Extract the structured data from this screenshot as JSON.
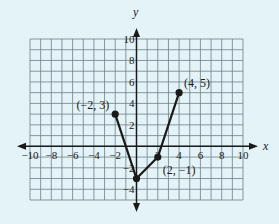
{
  "chart_data": {
    "type": "line",
    "title": "",
    "xlabel": "x",
    "ylabel": "y",
    "xlim": [
      -10,
      10
    ],
    "ylim": [
      -5,
      10
    ],
    "grid": true,
    "x_ticks": [
      -10,
      -8,
      -6,
      -4,
      -2,
      2,
      4,
      6,
      8,
      10
    ],
    "x_tick_labels": [
      "−10",
      "−8",
      "−6",
      "−4",
      "−2",
      "2",
      "4",
      "6",
      "8",
      "10"
    ],
    "y_ticks": [
      10,
      8,
      6,
      4,
      2,
      -2,
      -4
    ],
    "y_tick_labels": [
      "10",
      "8",
      "6",
      "4",
      "2",
      "−2",
      "−4"
    ],
    "series": [
      {
        "name": "piecewise",
        "x": [
          -2,
          0,
          2,
          4
        ],
        "y": [
          3,
          -3,
          -1,
          5
        ],
        "color": "#1a1a1a"
      }
    ],
    "points": [
      {
        "x": -2,
        "y": 3,
        "label": "(−2, 3)"
      },
      {
        "x": 0,
        "y": -3,
        "label": ""
      },
      {
        "x": 2,
        "y": -1,
        "label": "(2, −1)"
      },
      {
        "x": 4,
        "y": 5,
        "label": "(4, 5)"
      }
    ]
  },
  "colors": {
    "background": "#e4f3f7",
    "grid": "#6d7f86",
    "ink": "#1a1a1a"
  }
}
